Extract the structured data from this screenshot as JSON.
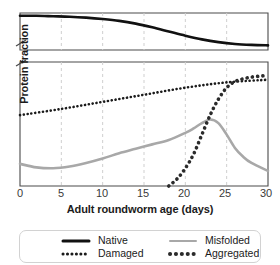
{
  "chart_data": {
    "type": "line",
    "title": "",
    "xlabel": "Adult roundworm age (days)",
    "ylabel": "Protein fraction",
    "xlim": [
      0,
      30
    ],
    "ylim": [
      0,
      1
    ],
    "xticks": [
      0,
      5,
      10,
      15,
      20,
      25,
      30
    ],
    "yticks": [],
    "grid": "vertical dashed at every 5 days",
    "legend_position": "bottom",
    "broken_axis": true,
    "axis_break_note": "y-axis is broken: upper panel shows the high Native fraction, lower panel shows the small fractions",
    "series": [
      {
        "name": "Native",
        "panel": "upper",
        "style": "solid",
        "color": "#111111",
        "width": 2.6,
        "x": [
          0,
          2,
          4,
          6,
          8,
          10,
          12,
          14,
          16,
          18,
          20,
          22,
          24,
          26,
          28,
          30
        ],
        "y": [
          0.97,
          0.97,
          0.965,
          0.96,
          0.95,
          0.935,
          0.915,
          0.885,
          0.845,
          0.8,
          0.755,
          0.715,
          0.685,
          0.665,
          0.655,
          0.65
        ]
      },
      {
        "name": "Damaged",
        "panel": "lower",
        "style": "dotted",
        "color": "#1b1b1b",
        "width": 2.6,
        "x": [
          0,
          5,
          10,
          15,
          20,
          25,
          30
        ],
        "y": [
          0.4,
          0.435,
          0.475,
          0.515,
          0.555,
          0.585,
          0.6
        ]
      },
      {
        "name": "Misfolded",
        "panel": "lower",
        "style": "solid",
        "color": "#a8a8a8",
        "width": 2.6,
        "x": [
          0,
          2,
          4,
          6,
          8,
          10,
          12,
          14,
          16,
          18,
          20,
          21,
          22,
          23,
          24,
          25,
          26,
          27,
          28,
          30
        ],
        "y": [
          0.125,
          0.105,
          0.1,
          0.11,
          0.13,
          0.155,
          0.185,
          0.21,
          0.235,
          0.26,
          0.3,
          0.325,
          0.355,
          0.375,
          0.355,
          0.29,
          0.215,
          0.165,
          0.13,
          0.085
        ]
      },
      {
        "name": "Aggregated",
        "panel": "lower",
        "style": "dotted",
        "color": "#2b2b2b",
        "width": 3.6,
        "x": [
          18,
          19,
          20,
          21,
          22,
          23,
          24,
          25,
          26,
          27,
          28,
          29,
          30
        ],
        "y": [
          0.0,
          0.04,
          0.1,
          0.18,
          0.29,
          0.4,
          0.49,
          0.555,
          0.59,
          0.605,
          0.615,
          0.62,
          0.625
        ]
      }
    ]
  },
  "axes": {
    "xlabel": "Adult roundworm age (days)",
    "ylabel": "Protein fraction",
    "xticklabels": [
      "0",
      "5",
      "10",
      "15",
      "20",
      "25",
      "30"
    ]
  },
  "legend": {
    "entries": [
      {
        "label": "Native",
        "swatch": "thick-solid-black-line"
      },
      {
        "label": "Damaged",
        "swatch": "dotted-black-line"
      },
      {
        "label": "Misfolded",
        "swatch": "thin-solid-gray-line"
      },
      {
        "label": "Aggregated",
        "swatch": "thick-dotted-black-line"
      }
    ]
  },
  "colors": {
    "native": "#111111",
    "damaged": "#1b1b1b",
    "misfolded": "#a8a8a8",
    "aggregated": "#2b2b2b",
    "grid": "#cfcfcf",
    "axis": "#4a4a4a",
    "legend_border": "#d2d2d2"
  }
}
